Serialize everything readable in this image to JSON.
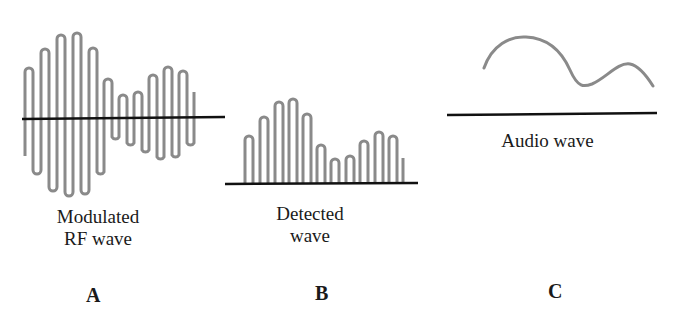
{
  "figure": {
    "panels": [
      {
        "id": "A",
        "letter": "A",
        "caption_line1": "Modulated",
        "caption_line2": "RF wave",
        "description": "Amplitude-modulated carrier oscillating above and below a baseline"
      },
      {
        "id": "B",
        "letter": "B",
        "caption_line1": "Detected",
        "caption_line2": "wave",
        "description": "Rectified pulses above baseline following the envelope"
      },
      {
        "id": "C",
        "letter": "C",
        "caption_line1": "Audio wave",
        "description": "Smooth envelope curve above baseline"
      }
    ],
    "colors": {
      "wave": "#8a8a8a",
      "axis": "#111111",
      "text": "#1a1a1a"
    }
  }
}
